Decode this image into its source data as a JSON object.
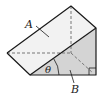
{
  "diagram": {
    "type": "triangular-prism-wedge",
    "labels": {
      "face_top": "A",
      "face_end": "B",
      "angle": "θ"
    },
    "colors": {
      "top_face": "#f2f2f2",
      "end_face": "#d4d4d4",
      "edge": "#1a1a1a",
      "hidden_edge": "#777777"
    },
    "markers": {
      "right_angle": true,
      "angle_arc": true
    }
  }
}
